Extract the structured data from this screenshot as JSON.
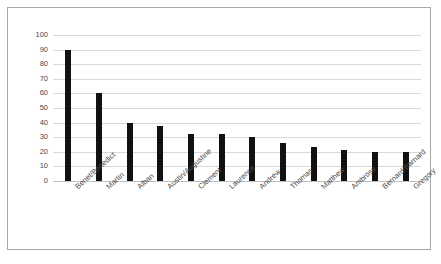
{
  "chart_data": {
    "type": "bar",
    "title": "",
    "subtitle": "",
    "xlabel": "",
    "ylabel": "",
    "ylim": [
      0,
      100
    ],
    "ytick_step": 10,
    "yticks": [
      100,
      90,
      80,
      70,
      60,
      50,
      40,
      30,
      20,
      10,
      0
    ],
    "grid": true,
    "legend": false,
    "legend_position": "none",
    "bar_color": "#111111",
    "gridline_color": "#d9d9d9",
    "axis_color": "#bfbfbf",
    "frame_color": "#a8a8a8",
    "categories": [
      "Benet/Benedict",
      "Martin",
      "Alban",
      "Austin/Augustine",
      "Clement",
      "Laurence",
      "Andrew",
      "Thomas",
      "Matthew",
      "Ambrose",
      "Bernard/Barnard",
      "Gregory"
    ],
    "values": [
      90,
      60,
      40,
      38,
      32,
      32,
      30,
      26,
      23,
      21,
      20,
      20
    ],
    "series": [
      {
        "name": "",
        "values": [
          90,
          60,
          40,
          38,
          32,
          32,
          30,
          26,
          23,
          21,
          20,
          20
        ]
      }
    ]
  }
}
